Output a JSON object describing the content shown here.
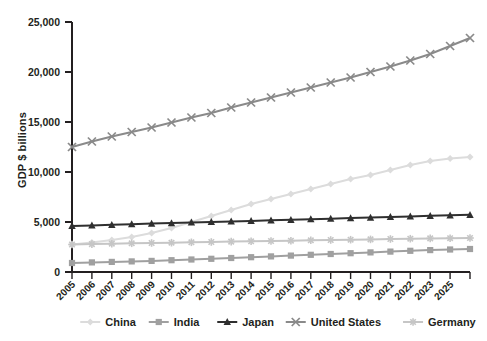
{
  "chart_data": {
    "type": "line",
    "title": "",
    "xlabel": "",
    "ylabel": "GDP $ billions",
    "ylim": [
      0,
      25000
    ],
    "yticks": [
      0,
      5000,
      10000,
      15000,
      20000,
      25000
    ],
    "ytick_labels": [
      "0",
      "5,000",
      "10,000",
      "15,000",
      "20,000",
      "25,000"
    ],
    "grid": false,
    "legend_position": "bottom",
    "x": [
      2005,
      2006,
      2007,
      2008,
      2009,
      2010,
      2011,
      2012,
      2013,
      2014,
      2015,
      2016,
      2017,
      2018,
      2019,
      2020,
      2021,
      2022,
      2023,
      2024,
      2025
    ],
    "xtick_labels": [
      "2005",
      "2006",
      "2007",
      "2008",
      "2009",
      "2010",
      "2011",
      "2012",
      "2013",
      "2014",
      "2015",
      "2016",
      "2017",
      "2018",
      "2019",
      "2020",
      "2021",
      "2022",
      "2023",
      "2025"
    ],
    "series": [
      {
        "name": "China",
        "color": "#dcdcdc",
        "marker": "diamond",
        "values": [
          2750,
          2950,
          3200,
          3500,
          3900,
          4400,
          5000,
          5600,
          6200,
          6800,
          7300,
          7800,
          8300,
          8800,
          9300,
          9700,
          10200,
          10700,
          11100,
          11350,
          11500
        ]
      },
      {
        "name": "India",
        "color": "#a0a0a0",
        "marker": "square",
        "values": [
          900,
          960,
          1010,
          1060,
          1110,
          1180,
          1250,
          1320,
          1400,
          1480,
          1560,
          1640,
          1720,
          1800,
          1880,
          1960,
          2040,
          2120,
          2190,
          2250,
          2300
        ]
      },
      {
        "name": "Japan",
        "color": "#2f2f2f",
        "marker": "triangle",
        "values": [
          4600,
          4660,
          4720,
          4780,
          4840,
          4890,
          4950,
          5000,
          5060,
          5110,
          5170,
          5220,
          5280,
          5330,
          5390,
          5440,
          5500,
          5560,
          5620,
          5670,
          5720
        ]
      },
      {
        "name": "United States",
        "color": "#8a8a8a",
        "marker": "x",
        "values": [
          12500,
          13050,
          13550,
          14000,
          14450,
          14950,
          15450,
          15900,
          16450,
          16950,
          17450,
          17950,
          18450,
          18950,
          19450,
          20000,
          20550,
          21150,
          21800,
          22600,
          23400
        ]
      },
      {
        "name": "Germany",
        "color": "#c6c6c6",
        "marker": "asterisk",
        "values": [
          2750,
          2790,
          2830,
          2870,
          2900,
          2930,
          2970,
          3000,
          3040,
          3070,
          3100,
          3130,
          3170,
          3200,
          3230,
          3260,
          3300,
          3330,
          3360,
          3380,
          3400
        ]
      }
    ]
  }
}
